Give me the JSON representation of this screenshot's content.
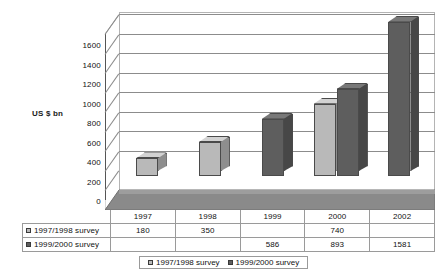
{
  "chart_data": {
    "type": "bar",
    "title": "",
    "subtitle": "",
    "xlabel": "",
    "ylabel": "US $ bn",
    "ylim": [
      0,
      1600
    ],
    "ytick_step": 200,
    "yticks": [
      1600,
      1400,
      1200,
      1000,
      800,
      600,
      400,
      200,
      0
    ],
    "grid": true,
    "legend_position": "bottom",
    "style": "3d-clustered-column-grayscale",
    "categories": [
      "1997",
      "1998",
      "1999",
      "2000",
      "2002"
    ],
    "series": [
      {
        "name": "1997/1998 survey",
        "color": "#b9b9b9",
        "values": [
          180,
          350,
          null,
          740,
          null
        ],
        "display_values": [
          "180",
          "350",
          "",
          "740",
          ""
        ]
      },
      {
        "name": "1999/2000 survey",
        "color": "#5e5e5e",
        "values": [
          null,
          null,
          586,
          893,
          1581
        ],
        "display_values": [
          "",
          "",
          "586",
          "893",
          "1581"
        ]
      }
    ]
  },
  "data_table": {
    "category_header": [
      "1997",
      "1998",
      "1999",
      "2000",
      "2002"
    ],
    "rows": [
      {
        "label": "1997/1998 survey",
        "swatch": "#b9b9b9",
        "cells": [
          "180",
          "350",
          "",
          "740",
          ""
        ]
      },
      {
        "label": "1999/2000 survey",
        "swatch": "#5e5e5e",
        "cells": [
          "",
          "",
          "586",
          "893",
          "1581"
        ]
      }
    ]
  },
  "legend": {
    "items": [
      {
        "label": "1997/1998 survey",
        "color": "#b9b9b9"
      },
      {
        "label": "1999/2000 survey",
        "color": "#5e5e5e"
      }
    ]
  },
  "colors": {
    "series1_front": "#b9b9b9",
    "series1_side": "#8e8e8e",
    "series1_top": "#d2d2d2",
    "series2_front": "#5e5e5e",
    "series2_side": "#474747",
    "series2_top": "#787878",
    "floor": "#8a8a8a",
    "floor_edge": "#a5a5a5",
    "gridline": "#8c8c8c",
    "wall_border": "#b4b4b4"
  }
}
